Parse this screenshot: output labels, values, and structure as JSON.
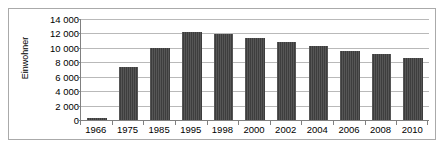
{
  "chart_data": {
    "type": "bar",
    "title": "",
    "xlabel": "",
    "ylabel": "Einwohner",
    "ylim": [
      0,
      14000
    ],
    "ytick_step": 2000,
    "grid": true,
    "legend": "none",
    "bar_color": "#3d3d3d",
    "gridline_color": "#b9b9b9",
    "axis_color": "#808080",
    "border_color": "#aaaaaa",
    "background_color": "#ffffff",
    "ytick_labels": [
      "14 000",
      "12 000",
      "10 000",
      "8 000",
      "6 000",
      "4 000",
      "2 000",
      "0"
    ],
    "ytick_values": [
      14000,
      12000,
      10000,
      8000,
      6000,
      4000,
      2000,
      0
    ],
    "categories": [
      "1966",
      "1975",
      "1985",
      "1995",
      "1998",
      "2000",
      "2002",
      "2004",
      "2006",
      "2008",
      "2010"
    ],
    "values": [
      250,
      7350,
      10000,
      12200,
      11900,
      11350,
      10750,
      10200,
      9600,
      9200,
      8650
    ]
  }
}
